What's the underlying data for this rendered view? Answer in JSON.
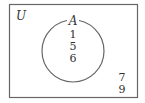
{
  "diagram": {
    "type": "venn",
    "universe": {
      "label": "U"
    },
    "sets": [
      {
        "label": "A",
        "elements": [
          "1",
          "5",
          "6"
        ]
      }
    ],
    "outside_elements": [
      "7",
      "9"
    ],
    "colors": {
      "stroke": "#555555",
      "text": "#333333",
      "background": "#ffffff"
    }
  }
}
